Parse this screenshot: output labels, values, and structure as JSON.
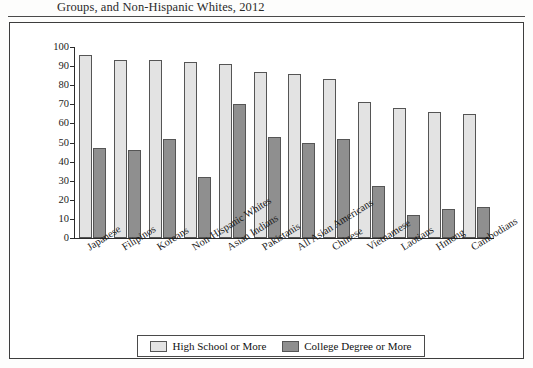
{
  "caption": {
    "text": "Groups, and Non-Hispanic Whites, 2012"
  },
  "legend": {
    "items": [
      {
        "label": "High School or More",
        "color": "#e3e3e3",
        "name": "legend-high-school"
      },
      {
        "label": "College Degree or More",
        "color": "#8f8f8f",
        "name": "legend-college-degree"
      }
    ]
  },
  "chart_data": {
    "type": "bar",
    "title": "Groups, and Non-Hispanic Whites, 2012",
    "xlabel": "",
    "ylabel": "",
    "ylim": [
      0,
      100
    ],
    "yticks": [
      0,
      10,
      20,
      30,
      40,
      50,
      60,
      70,
      80,
      90,
      100
    ],
    "grid": false,
    "legend_position": "bottom",
    "categories": [
      "Japanese",
      "Filipinos",
      "Koreans",
      "Non-Hispanic Whites",
      "Asian Indians",
      "Pakistanis",
      "All Asian Americans",
      "Chinese",
      "Vietnamese",
      "Laotians",
      "Hmong",
      "Cambodians"
    ],
    "series": [
      {
        "name": "High School or More",
        "color": "#e3e3e3",
        "values": [
          96,
          93,
          93,
          92,
          91,
          87,
          86,
          83,
          71,
          68,
          66,
          65
        ]
      },
      {
        "name": "College Degree or More",
        "color": "#8f8f8f",
        "values": [
          47,
          46,
          52,
          32,
          70,
          53,
          50,
          52,
          27,
          12,
          15,
          16
        ]
      }
    ]
  }
}
